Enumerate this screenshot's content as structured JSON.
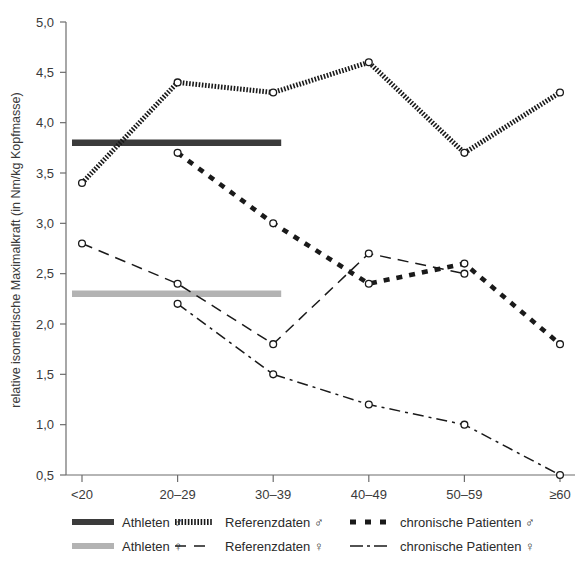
{
  "chart_data": {
    "type": "line",
    "title": "",
    "xlabel": "",
    "ylabel": "relative isometrische Maximalkraft (in Nm/kg Kopfmasse)",
    "categories": [
      "<20",
      "20–29",
      "30–39",
      "40–49",
      "50–59",
      "≥60"
    ],
    "ylim": [
      0.5,
      5.0
    ],
    "ytick_labels": [
      "0,5",
      "1,0",
      "1,5",
      "2,0",
      "2,5",
      "3,0",
      "3,5",
      "4,0",
      "4,5",
      "5,0"
    ],
    "ytick_values": [
      0.5,
      1.0,
      1.5,
      2.0,
      2.5,
      3.0,
      3.5,
      4.0,
      4.5,
      5.0
    ],
    "grid": false,
    "legend_position": "bottom",
    "series": [
      {
        "name": "Athleten ♂",
        "style": "thick-solid",
        "color": "#3b3b3b",
        "kind": "reference-band",
        "value": 3.8,
        "x_from": "<20",
        "x_to": "30–39",
        "values": [
          3.8,
          3.8,
          3.8,
          null,
          null,
          null
        ]
      },
      {
        "name": "Athleten ♀",
        "style": "thick-solid",
        "color": "#b3b3b3",
        "kind": "reference-band",
        "value": 2.3,
        "x_from": "<20",
        "x_to": "30–39",
        "values": [
          2.3,
          2.3,
          2.3,
          null,
          null,
          null
        ]
      },
      {
        "name": "Referenzdaten ♂",
        "style": "hatched-thick",
        "color": "#1a1a1a",
        "kind": "line",
        "values": [
          3.4,
          4.4,
          4.3,
          4.6,
          3.7,
          4.3
        ]
      },
      {
        "name": "Referenzdaten ♀",
        "style": "dashed",
        "color": "#1a1a1a",
        "kind": "line",
        "values": [
          2.8,
          2.4,
          1.8,
          2.7,
          2.5,
          null
        ]
      },
      {
        "name": "chronische Patienten ♂",
        "style": "thick-dashed",
        "color": "#1a1a1a",
        "kind": "line",
        "values": [
          null,
          3.7,
          3.0,
          2.4,
          2.6,
          1.8
        ]
      },
      {
        "name": "chronische Patienten ♀",
        "style": "dash-dot",
        "color": "#1a1a1a",
        "kind": "line",
        "values": [
          null,
          2.2,
          1.5,
          1.2,
          1.0,
          0.5
        ]
      }
    ]
  },
  "legend": {
    "items": [
      {
        "label": "Athleten ♂",
        "swatch": "thick-solid-dark"
      },
      {
        "label": "Referenzdaten ♂",
        "swatch": "hatched"
      },
      {
        "label": "chronische Patienten ♂",
        "swatch": "thick-dashed"
      },
      {
        "label": "Athleten ♀",
        "swatch": "thick-solid-gray"
      },
      {
        "label": "Referenzdaten ♀",
        "swatch": "dashed"
      },
      {
        "label": "chronische Patienten ♀",
        "swatch": "dash-dot"
      }
    ]
  }
}
